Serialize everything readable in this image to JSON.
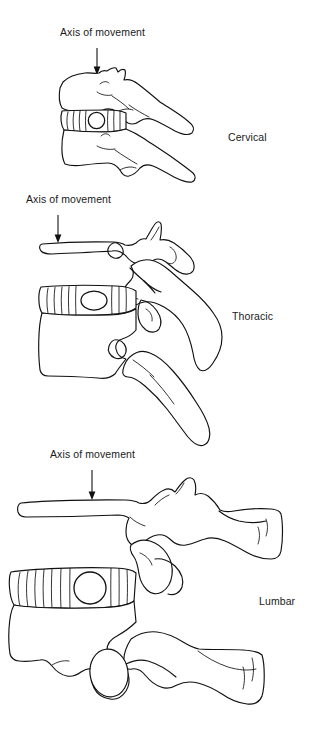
{
  "figure": {
    "background_color": "#ffffff",
    "ink_color": "#111111",
    "width": 322,
    "height": 753
  },
  "panels": [
    {
      "id": "cervical",
      "region_label": "Cervical",
      "axis_label": "Axis of movement",
      "axis_marker_shape": "circle",
      "axis_marker_note": "nucleus pulposus marker in intervertebral disc",
      "arrow_direction": "down",
      "label_x": 232,
      "label_y": 137,
      "axis_label_x": 60,
      "axis_label_y": 33,
      "arrow_x": 97,
      "arrow_top_y": 48,
      "arrow_bottom_y": 74
    },
    {
      "id": "thoracic",
      "region_label": "Thoracic",
      "axis_label": "Axis of movement",
      "axis_marker_shape": "ellipse",
      "axis_marker_note": "nucleus pulposus marker in intervertebral disc",
      "arrow_direction": "down",
      "label_x": 236,
      "label_y": 316,
      "axis_label_x": 26,
      "axis_label_y": 200,
      "arrow_x": 58,
      "arrow_top_y": 215,
      "arrow_bottom_y": 242
    },
    {
      "id": "lumbar",
      "region_label": "Lumbar",
      "axis_label": "Axis of movement",
      "axis_marker_shape": "circle",
      "axis_marker_note": "nucleus pulposus marker in intervertebral disc",
      "arrow_direction": "down",
      "label_x": 263,
      "label_y": 601,
      "axis_label_x": 48,
      "axis_label_y": 455,
      "arrow_x": 92,
      "arrow_top_y": 470,
      "arrow_bottom_y": 500
    }
  ]
}
